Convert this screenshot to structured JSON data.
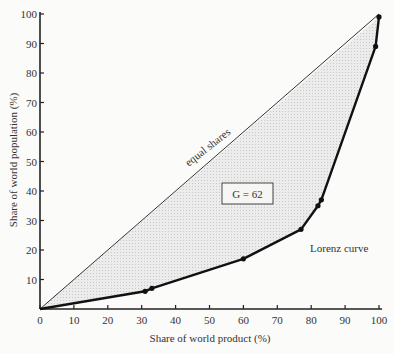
{
  "chart_data": {
    "type": "line",
    "title": "",
    "xlabel": "Share of world product (%)",
    "ylabel": "Share of world population (%)",
    "xlim": [
      0,
      100
    ],
    "ylim": [
      0,
      100
    ],
    "x_ticks": [
      0,
      10,
      20,
      30,
      40,
      50,
      60,
      70,
      80,
      90,
      100
    ],
    "y_ticks": [
      10,
      20,
      30,
      40,
      50,
      60,
      70,
      80,
      90,
      100
    ],
    "grid": false,
    "series": [
      {
        "name": "equal shares",
        "points": [
          [
            0,
            0
          ],
          [
            100,
            100
          ]
        ]
      },
      {
        "name": "Lorenz curve",
        "points": [
          [
            0,
            0
          ],
          [
            31,
            6
          ],
          [
            33,
            7
          ],
          [
            60,
            17
          ],
          [
            77,
            27
          ],
          [
            82,
            35
          ],
          [
            83,
            37
          ],
          [
            99,
            89
          ],
          [
            100,
            99
          ]
        ]
      }
    ],
    "annotations": [
      {
        "text": "equal shares"
      },
      {
        "text": "G = 62"
      },
      {
        "text": "Lorenz curve"
      }
    ]
  },
  "labels": {
    "equal": "equal shares",
    "gini": "G = 62",
    "lorenz": "Lorenz curve",
    "xlabel": "Share of world product (%)",
    "ylabel": "Share of world population (%)"
  }
}
